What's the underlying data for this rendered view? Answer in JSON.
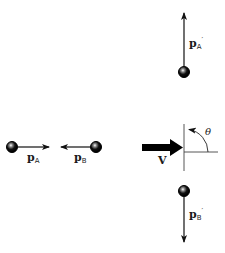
{
  "diagram": {
    "type": "collision-momentum-diagram",
    "colors": {
      "ink": "#111111",
      "axis": "#444444",
      "background": "#ffffff"
    },
    "before": {
      "particle_a": {
        "label": "p",
        "subscript": "A",
        "direction": "right"
      },
      "particle_b": {
        "label": "p",
        "subscript": "B",
        "direction": "left"
      }
    },
    "velocity": {
      "label": "V",
      "direction": "right"
    },
    "angle": {
      "label": "θ"
    },
    "after": {
      "particle_a": {
        "label": "p",
        "subscript": "A",
        "prime": "′",
        "direction": "up"
      },
      "particle_b": {
        "label": "p",
        "subscript": "B",
        "prime": "′",
        "direction": "down"
      }
    }
  }
}
